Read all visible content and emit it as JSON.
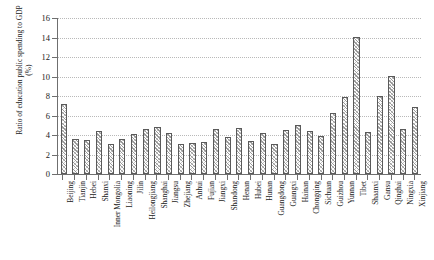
{
  "chart_data": {
    "type": "bar",
    "title": "",
    "xlabel": "",
    "ylabel": "Ratio of education public spending to GDP (%)",
    "ylim": [
      0,
      16
    ],
    "yticks": [
      0,
      2,
      4,
      6,
      8,
      10,
      12,
      14,
      16
    ],
    "grid": true,
    "legend": "none",
    "categories": [
      "Beijing",
      "Tianjin",
      "Hebei",
      "Shanxi",
      "Inner Mongolia",
      "Liaoning",
      "Jilin",
      "Heilongjiang",
      "Shanghai",
      "Jiangsu",
      "Zhejiang",
      "Anhui",
      "Fujian",
      "Jiangxi",
      "Shandong",
      "Henan",
      "Hubei",
      "Hunan",
      "Guangdong",
      "Guangxi",
      "Hainan",
      "Chongqing",
      "Sichuan",
      "Guizhou",
      "Yunnan",
      "Tibet",
      "Shaanxi",
      "Gansu",
      "Qinghai",
      "Ningxia",
      "Xinjiang"
    ],
    "values": [
      7.1,
      3.6,
      3.5,
      4.4,
      3.1,
      3.6,
      4.1,
      4.6,
      4.8,
      4.2,
      3.1,
      3.2,
      3.3,
      4.6,
      3.8,
      4.7,
      3.4,
      4.2,
      3.1,
      4.5,
      5.0,
      4.4,
      3.9,
      6.2,
      7.8,
      14.0,
      4.3,
      8.0,
      10.0,
      4.6,
      6.8
    ]
  },
  "colors": {
    "axis": "#6f6f6f",
    "grid": "#b9b9b9",
    "bar_edge": "#5a5a5a",
    "bar_hatch": "#9a9a9a",
    "text": "#1a1a1a",
    "background": "#ffffff"
  }
}
